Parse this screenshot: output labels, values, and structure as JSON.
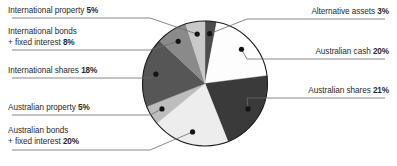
{
  "chart_data": {
    "type": "pie",
    "title": "",
    "subtitle": "",
    "xlabel": "",
    "ylabel": "",
    "legend_position": "callout-labels",
    "grid": false,
    "units": "%",
    "start_angle_deg": 0,
    "direction": "clockwise",
    "categories": [
      "Alternative assets",
      "Australian cash",
      "Australian shares",
      "Australian bonds + fixed interest",
      "Australian property",
      "International shares",
      "International bonds + fixed interest",
      "International property"
    ],
    "values": [
      3,
      20,
      21,
      20,
      5,
      18,
      8,
      5
    ],
    "slices": [
      {
        "name": "Alternative assets",
        "value": 3,
        "label": "Alternative assets",
        "percent_text": "3%",
        "color": "#4c4c4c",
        "side": "right"
      },
      {
        "name": "Australian cash",
        "value": 20,
        "label": "Australian cash",
        "percent_text": "20%",
        "color": "#fdfdfd",
        "side": "right"
      },
      {
        "name": "Australian shares",
        "value": 21,
        "label": "Australian shares",
        "percent_text": "21%",
        "color": "#3a3a3a",
        "side": "right"
      },
      {
        "name": "Australian bonds + fixed interest",
        "value": 20,
        "label": "Australian bonds",
        "label_line2": "+ fixed interest",
        "percent_text": "20%",
        "color": "#ededed",
        "side": "left"
      },
      {
        "name": "Australian property",
        "value": 5,
        "label": "Australian property",
        "percent_text": "5%",
        "color": "#bdbdbd",
        "side": "left"
      },
      {
        "name": "International shares",
        "value": 18,
        "label": "International shares",
        "percent_text": "18%",
        "color": "#565656",
        "side": "left"
      },
      {
        "name": "International bonds + fixed interest",
        "value": 8,
        "label": "International bonds",
        "label_line2": "+ fixed interest",
        "percent_text": "8%",
        "color": "#8a8a8a",
        "side": "left"
      },
      {
        "name": "International property",
        "value": 5,
        "label": "International property",
        "percent_text": "5%",
        "color": "#c9c9c9",
        "side": "left"
      }
    ]
  },
  "labels": {
    "international_property": {
      "text": "International property ",
      "pct": "5%"
    },
    "international_bonds_l1": {
      "text": "International bonds"
    },
    "international_bonds_l2": {
      "text": "+ fixed interest  ",
      "pct": "8%"
    },
    "international_shares": {
      "text": "International shares ",
      "pct": "18%"
    },
    "australian_property": {
      "text": "Australian property ",
      "pct": "5%"
    },
    "australian_bonds_l1": {
      "text": "Australian bonds"
    },
    "australian_bonds_l2": {
      "text": "+ fixed interest ",
      "pct": "20%"
    },
    "alternative_assets": {
      "text": "Alternative assets ",
      "pct": "3%"
    },
    "australian_cash": {
      "text": "Australian cash ",
      "pct": "20%"
    },
    "australian_shares": {
      "text": "Australian shares ",
      "pct": "21%"
    }
  },
  "colors": {
    "text": "#2a2a2a",
    "leader_line": "#6b6b6b",
    "pie_outline": "#1b1b1b",
    "marker_dot": "#141414",
    "background": "#ffffff"
  }
}
